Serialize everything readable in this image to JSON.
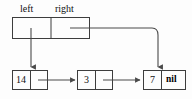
{
  "figure": {
    "colors": {
      "stroke": "#4a4a4a",
      "box_stroke": "#3d3d3d",
      "text": "#111111",
      "background": "#fdfdfd"
    }
  },
  "header_record": {
    "name": "header-record",
    "fields": [
      {
        "label": "left",
        "value": ""
      },
      {
        "label": "right",
        "value": ""
      }
    ]
  },
  "nodes": [
    {
      "id": "node-14",
      "value": "14",
      "next": "node-3"
    },
    {
      "id": "node-3",
      "value": "3",
      "next": "node-7"
    },
    {
      "id": "node-7",
      "value": "7",
      "next": "nil",
      "next_label": "nil"
    }
  ],
  "pointers": [
    {
      "name": "left-pointer",
      "from": "header-record.left",
      "to": "node-14",
      "style": "vertical-arrow"
    },
    {
      "name": "right-pointer",
      "from": "header-record.right",
      "to": "node-7",
      "style": "elbow-curve-arrow"
    },
    {
      "name": "next-pointer-14",
      "from": "node-14.next",
      "to": "node-3",
      "style": "horizontal-arrow"
    },
    {
      "name": "next-pointer-3",
      "from": "node-3.next",
      "to": "node-7",
      "style": "horizontal-arrow"
    }
  ]
}
